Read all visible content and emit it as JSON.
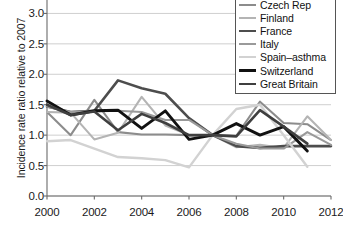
{
  "chart_data": {
    "type": "line",
    "title": "",
    "xlabel": "",
    "ylabel": "Incidence rate ratio relative to 2007",
    "x": [
      2000,
      2001,
      2002,
      2003,
      2004,
      2005,
      2006,
      2007,
      2008,
      2009,
      2010,
      2011,
      2012
    ],
    "xlim": [
      2000,
      2012
    ],
    "ylim": [
      0.0,
      3.5
    ],
    "xticks": [
      "2000",
      "2002",
      "2004",
      "2006",
      "2008",
      "2010",
      "2012"
    ],
    "yticks": [
      "0.0",
      "0.5",
      "1.0",
      "1.5",
      "2.0",
      "2.5",
      "3.0",
      "3.5"
    ],
    "grid": "horizontal",
    "legend_position": "top-right",
    "series": [
      {
        "name": "Czech Rep",
        "color": "#8c8c8c",
        "width": 2.1,
        "x": [
          2000,
          2001,
          2002,
          2003,
          2004,
          2005,
          2006,
          2007,
          2008,
          2009,
          2010,
          2011,
          2012
        ],
        "values": [
          1.38,
          1.0,
          1.58,
          1.05,
          1.01,
          1.01,
          1.0,
          1.0,
          0.99,
          1.55,
          1.2,
          1.18,
          0.92
        ]
      },
      {
        "name": "Finland",
        "color": "#b4b4b4",
        "width": 2.1,
        "x": [
          2000,
          2001,
          2002,
          2003,
          2004,
          2005,
          2006,
          2007,
          2008,
          2009,
          2010,
          2011,
          2012
        ],
        "values": [
          1.38,
          1.37,
          0.93,
          1.04,
          1.63,
          1.16,
          1.0,
          1.0,
          0.8,
          0.84,
          0.79,
          1.31,
          0.92
        ]
      },
      {
        "name": "France",
        "color": "#4d4d4d",
        "width": 2.6,
        "x": [
          2000,
          2001,
          2002,
          2003,
          2004,
          2005,
          2006,
          2007,
          2008,
          2009,
          2010,
          2011,
          2012
        ],
        "values": [
          1.47,
          1.38,
          1.4,
          1.9,
          1.77,
          1.68,
          1.28,
          1.0,
          0.82,
          0.79,
          0.82,
          0.82,
          0.82
        ]
      },
      {
        "name": "Italy",
        "color": "#9a9a9a",
        "width": 2.1,
        "x": [
          2000,
          2001,
          2002,
          2003,
          2004,
          2005,
          2006,
          2007,
          2008,
          2009,
          2010,
          2011,
          2012
        ],
        "values": [
          1.47,
          1.38,
          1.39,
          1.4,
          1.38,
          1.25,
          1.25,
          1.0,
          0.86,
          0.78,
          0.78,
          1.05,
          0.84
        ]
      },
      {
        "name": "Spain–asthma",
        "color": "#d2d2d2",
        "width": 2.4,
        "x": [
          2000,
          2001,
          2002,
          2003,
          2004,
          2005,
          2006,
          2007,
          2008,
          2009,
          2010,
          2011
        ],
        "values": [
          0.9,
          0.92,
          0.78,
          0.64,
          0.62,
          0.59,
          0.47,
          1.0,
          1.43,
          1.5,
          1.0,
          0.48
        ]
      },
      {
        "name": "Switzerland",
        "color": "#111111",
        "width": 2.9,
        "x": [
          2000,
          2001,
          2002,
          2003,
          2004,
          2005,
          2006,
          2007,
          2008,
          2009,
          2010,
          2011
        ],
        "values": [
          1.56,
          1.33,
          1.4,
          1.41,
          1.11,
          1.4,
          0.93,
          1.0,
          1.19,
          1.0,
          1.14,
          0.74
        ]
      },
      {
        "name": "Great Britain",
        "color": "#3f3f3f",
        "width": 2.6,
        "x": [
          2000,
          2001,
          2002,
          2003,
          2004,
          2005,
          2006,
          2007,
          2008,
          2009,
          2010,
          2011
        ],
        "values": [
          1.5,
          1.33,
          1.39,
          1.08,
          1.35,
          1.2,
          1.0,
          1.0,
          0.98,
          1.41,
          1.14,
          0.86
        ]
      }
    ]
  },
  "legend": {
    "items": [
      {
        "label": "Czech Rep"
      },
      {
        "label": "Finland"
      },
      {
        "label": "France"
      },
      {
        "label": "Italy"
      },
      {
        "label": "Spain–asthma"
      },
      {
        "label": "Switzerland"
      },
      {
        "label": "Great Britain"
      }
    ]
  }
}
